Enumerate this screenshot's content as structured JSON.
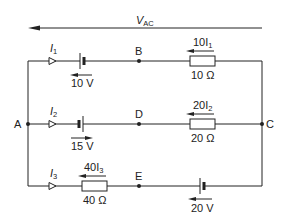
{
  "diagram": {
    "type": "circuit",
    "voltage_label": {
      "main": "V",
      "sub": "AC"
    },
    "nodes": [
      {
        "id": "A",
        "label": "A"
      },
      {
        "id": "B",
        "label": "B"
      },
      {
        "id": "C",
        "label": "C"
      },
      {
        "id": "D",
        "label": "D"
      },
      {
        "id": "E",
        "label": "E"
      }
    ],
    "branches": [
      {
        "current": {
          "main": "I",
          "sub": "1"
        },
        "battery_label": "10 V",
        "resistor_label": "10 Ω",
        "drop_label": {
          "main": "10I",
          "sub": "1"
        }
      },
      {
        "current": {
          "main": "I",
          "sub": "2"
        },
        "battery_label": "15 V",
        "resistor_label": "20 Ω",
        "drop_label": {
          "main": "20I",
          "sub": "2"
        }
      },
      {
        "current": {
          "main": "I",
          "sub": "3"
        },
        "battery_label": "20 V",
        "resistor_label": "40 Ω",
        "drop_label": {
          "main": "40I",
          "sub": "3"
        }
      }
    ],
    "colors": {
      "line": "#222222",
      "background": "#ffffff"
    }
  }
}
